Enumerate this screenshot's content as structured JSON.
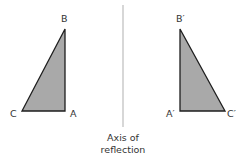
{
  "figure": {
    "left_triangle": {
      "vertices": {
        "top": "B",
        "bottom_left": "C",
        "bottom_right": "A"
      },
      "fill": "#a9a9a9",
      "stroke": "#1e1e1e"
    },
    "right_triangle": {
      "vertices": {
        "top": "B′",
        "bottom_left": "A′",
        "bottom_right": "C′"
      },
      "fill": "#a9a9a9",
      "stroke": "#1e1e1e"
    },
    "axis": {
      "color": "#bdbdbd",
      "caption_line1": "Axis of",
      "caption_line2": "reflection"
    }
  }
}
